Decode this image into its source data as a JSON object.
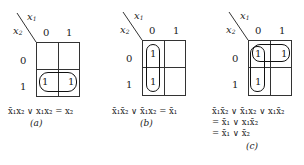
{
  "axes": {
    "column_var": "x",
    "column_sub": "1",
    "row_var": "x",
    "row_sub": "2",
    "column_values": [
      "0",
      "1"
    ],
    "row_values": [
      "0",
      "1"
    ]
  },
  "maps": [
    {
      "id": "a",
      "caption": "(a)",
      "cells": [
        [
          "",
          ""
        ],
        [
          "1",
          "1"
        ]
      ],
      "expression_lines": [
        "x̄₁x₂ ∨ x₁x₂ = x₂"
      ]
    },
    {
      "id": "b",
      "caption": "(b)",
      "cells": [
        [
          "1",
          ""
        ],
        [
          "1",
          ""
        ]
      ],
      "expression_lines": [
        "x̄₁x̄₂ ∨ x̄₁x₂ = x̄₁"
      ]
    },
    {
      "id": "c",
      "caption": "(c)",
      "cells": [
        [
          "1",
          "1"
        ],
        [
          "1",
          ""
        ]
      ],
      "expression_lines": [
        "x̄₁x̄₂ ∨ x̄₁x₂ ∨ x₁x̄₂",
        "= x̄₁ ∨ x₁x̄₂",
        "= x̄₁ ∨ x̄₂"
      ]
    }
  ],
  "labels": {
    "cap_a": "(a)",
    "cap_b": "(b)",
    "cap_c": "(c)",
    "one": "1",
    "zero": "0"
  }
}
